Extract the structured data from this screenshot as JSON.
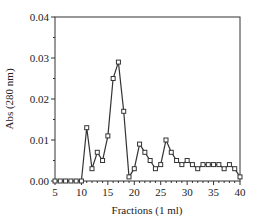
{
  "chart_data": {
    "type": "line",
    "title": "",
    "xlabel": "Fractions (1 ml)",
    "ylabel": "Abs (280 nm)",
    "xlim": [
      5,
      40
    ],
    "ylim": [
      0,
      0.04
    ],
    "x_ticks": [
      5,
      10,
      15,
      20,
      25,
      30,
      35,
      40
    ],
    "x_tick_labels": [
      "5",
      "10",
      "15",
      "20",
      "25",
      "30",
      "35",
      "40"
    ],
    "y_ticks": [
      0,
      0.01,
      0.02,
      0.03,
      0.04
    ],
    "y_tick_labels": [
      "0.00",
      "0.01",
      "0.02",
      "0.03",
      "0.04"
    ],
    "grid": false,
    "legend": null,
    "marker": "square",
    "series": [
      {
        "name": "Abs (280 nm)",
        "x": [
          5,
          6,
          7,
          8,
          9,
          10,
          11,
          12,
          13,
          14,
          15,
          16,
          17,
          18,
          19,
          20,
          21,
          22,
          23,
          24,
          25,
          26,
          27,
          28,
          29,
          30,
          31,
          32,
          33,
          34,
          35,
          36,
          37,
          38,
          39,
          40
        ],
        "values": [
          0,
          0,
          0,
          0,
          0,
          0,
          0.013,
          0.003,
          0.007,
          0.005,
          0.011,
          0.025,
          0.029,
          0.017,
          0.001,
          0.003,
          0.009,
          0.007,
          0.005,
          0.003,
          0.004,
          0.01,
          0.007,
          0.005,
          0.004,
          0.005,
          0.004,
          0.003,
          0.004,
          0.004,
          0.004,
          0.004,
          0.003,
          0.004,
          0.003,
          0.001
        ]
      }
    ],
    "colors": {
      "line": "#333333",
      "axis": "#333333",
      "background": "#ffffff"
    }
  }
}
